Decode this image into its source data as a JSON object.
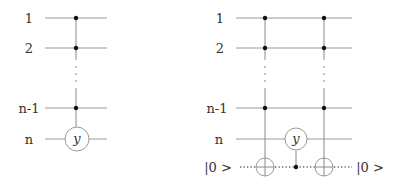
{
  "left_circuit": {
    "qubit_labels": [
      "1",
      "2",
      "n-1",
      "n"
    ],
    "gate_label": "y",
    "controls_on": [
      "1",
      "2",
      "n-1"
    ],
    "target": "n",
    "ellipsis": "⋮"
  },
  "right_circuit": {
    "qubit_labels": [
      "1",
      "2",
      "n-1",
      "n"
    ],
    "ancilla_in_label": "|0 >",
    "ancilla_out_label": "|0 >",
    "gate_label": "y",
    "ellipsis": "⋮",
    "gates": [
      {
        "type": "multi-controlled-not",
        "controls": [
          "1",
          "2",
          "n-1"
        ],
        "target": "ancilla"
      },
      {
        "type": "controlled-y",
        "control": "ancilla",
        "target": "n"
      },
      {
        "type": "multi-controlled-not",
        "controls": [
          "1",
          "2",
          "n-1"
        ],
        "target": "ancilla"
      }
    ]
  }
}
